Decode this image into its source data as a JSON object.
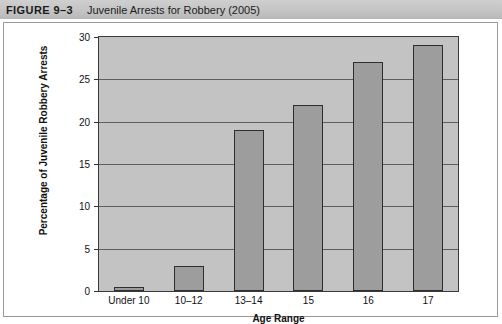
{
  "header": {
    "figure_number": "FIGURE 9–3",
    "figure_title": "Juvenile Arrests for Robbery (2005)"
  },
  "chart_data": {
    "type": "bar",
    "title": "Juvenile Arrests for Robbery (2005)",
    "categories": [
      "Under 10",
      "10–12",
      "13–14",
      "15",
      "16",
      "17"
    ],
    "values": [
      0.5,
      3,
      19,
      22,
      27,
      29
    ],
    "xlabel": "Age Range",
    "ylabel": "Percentage of Juvenile Robbery Arrests",
    "ylim": [
      0,
      30
    ],
    "yticks": [
      0,
      5,
      10,
      15,
      20,
      25,
      30
    ],
    "ytick_labels": [
      "0",
      "5",
      "10",
      "15",
      "20",
      "25",
      "30"
    ],
    "grid": true,
    "legend": false,
    "colors": {
      "bar_fill": "#9d9d9d",
      "bar_edge": "#2e2e2e",
      "plot_background": "#c3c3c3",
      "gridline": "#5e5e5e",
      "header_band": "#c4c4c4",
      "text": "#111111"
    }
  }
}
